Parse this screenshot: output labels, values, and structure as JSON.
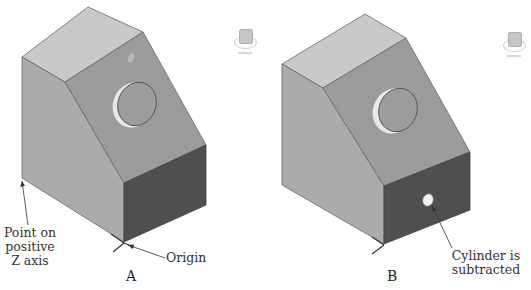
{
  "figure": {
    "panels": [
      {
        "id": "A",
        "caption": "A",
        "annotations": {
          "point_on_axis": [
            "Point on",
            "positive",
            "Z axis"
          ],
          "origin": "Origin"
        }
      },
      {
        "id": "B",
        "caption": "B",
        "annotations": {
          "cylinder": [
            "Cylinder is",
            "subtracted"
          ]
        }
      }
    ],
    "icons": {
      "view_cube": "view-cube-icon",
      "arrow": "annotation-arrow"
    },
    "colors": {
      "top_face": "#c9c9c9",
      "left_face": "#ababab",
      "slant_face": "#9b9b9b",
      "front_face": "#4f4f4f",
      "edge": "#6a6a6a",
      "label_text": "#333333"
    }
  }
}
